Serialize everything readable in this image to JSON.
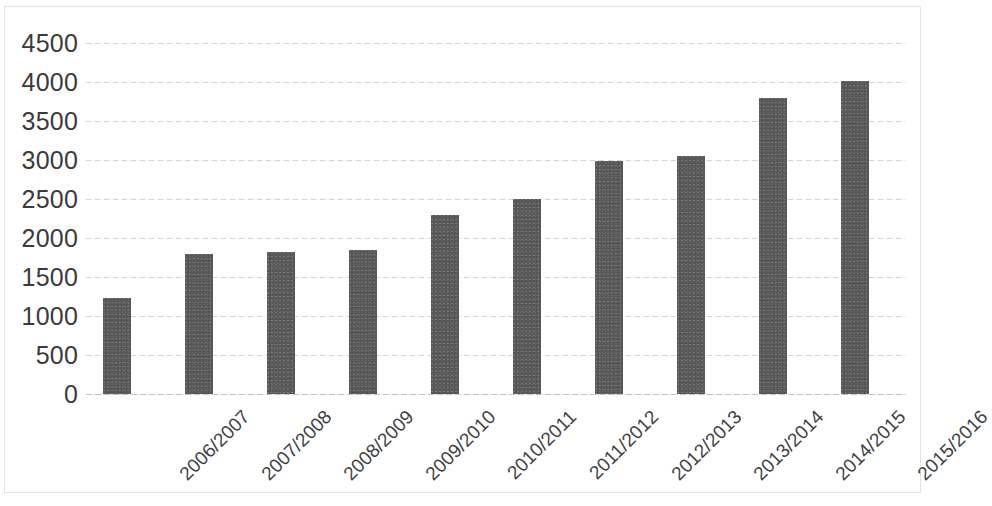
{
  "chart_data": {
    "type": "bar",
    "title": "",
    "xlabel": "",
    "ylabel": "",
    "ylim": [
      0,
      4500
    ],
    "y_ticks": [
      0,
      500,
      1000,
      1500,
      2000,
      2500,
      3000,
      3500,
      4000,
      4500
    ],
    "y_tick_labels": [
      "0",
      "500",
      "1000",
      "1500",
      "2000",
      "2500",
      "3000",
      "3500",
      "4000",
      "4500"
    ],
    "grid": "horizontal-dotted",
    "legend": "none",
    "bar_color": "#585858",
    "gridline_color": "#d4d4d4",
    "axis_text_color": "#3b3b3b",
    "background_color": "#ffffff",
    "categories": [
      "2006/2007",
      "2007/2008",
      "2008/2009",
      "2009/2010",
      "2010/2011",
      "2011/2012",
      "2012/2013",
      "2013/2014",
      "2014/2015",
      "2015/2016"
    ],
    "values": [
      1230,
      1795,
      1820,
      1845,
      2290,
      2500,
      2985,
      3050,
      3790,
      4010
    ]
  }
}
